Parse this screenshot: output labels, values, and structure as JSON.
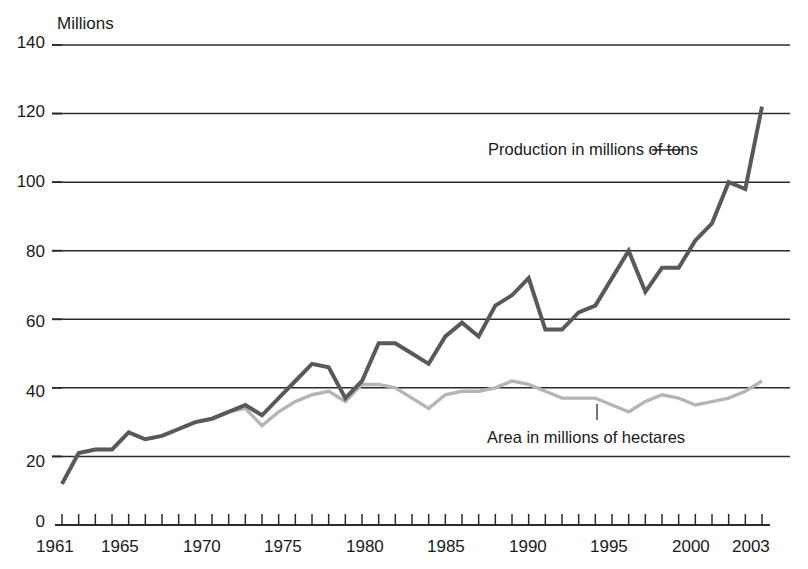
{
  "chart_data": {
    "type": "line",
    "title": "Millions",
    "xlabel": "",
    "ylabel": "",
    "grid": true,
    "legend_position": "inline-annotations",
    "xlim": [
      1961,
      2003
    ],
    "ylim": [
      0,
      140
    ],
    "yticks": [
      0,
      20,
      40,
      60,
      80,
      100,
      120,
      140
    ],
    "xticks_labeled": [
      1961,
      1965,
      1970,
      1975,
      1980,
      1985,
      1990,
      1995,
      2000,
      2003
    ],
    "xticks_all": [
      1961,
      1962,
      1963,
      1964,
      1965,
      1966,
      1967,
      1968,
      1969,
      1970,
      1971,
      1972,
      1973,
      1974,
      1975,
      1976,
      1977,
      1978,
      1979,
      1980,
      1981,
      1982,
      1983,
      1984,
      1985,
      1986,
      1987,
      1988,
      1989,
      1990,
      1991,
      1992,
      1993,
      1994,
      1995,
      1996,
      1997,
      1998,
      1999,
      2000,
      2001,
      2002,
      2003
    ],
    "x": [
      1961,
      1962,
      1963,
      1964,
      1965,
      1966,
      1967,
      1968,
      1969,
      1970,
      1971,
      1972,
      1973,
      1974,
      1975,
      1976,
      1977,
      1978,
      1979,
      1980,
      1981,
      1982,
      1983,
      1984,
      1985,
      1986,
      1987,
      1988,
      1989,
      1990,
      1991,
      1992,
      1993,
      1994,
      1995,
      1996,
      1997,
      1998,
      1999,
      2000,
      2001,
      2002,
      2003
    ],
    "series": [
      {
        "name": "Production in millions of tons",
        "color": "#595959",
        "values": [
          12,
          21,
          22,
          22,
          27,
          25,
          26,
          28,
          30,
          31,
          33,
          35,
          32,
          37,
          42,
          47,
          46,
          37,
          42,
          53,
          53,
          50,
          47,
          55,
          59,
          55,
          64,
          67,
          72,
          57,
          57,
          62,
          64,
          72,
          80,
          68,
          75,
          75,
          83,
          88,
          100,
          98,
          122
        ]
      },
      {
        "name": "Area in millions of hectares",
        "color": "#b5b5b5",
        "values": [
          12,
          21,
          22,
          22,
          27,
          25,
          26,
          28,
          30,
          31,
          33,
          34,
          29,
          33,
          36,
          38,
          39,
          36,
          41,
          41,
          40,
          37,
          34,
          38,
          39,
          39,
          40,
          42,
          41,
          39,
          37,
          37,
          37,
          35,
          33,
          36,
          38,
          37,
          35,
          36,
          37,
          39,
          42
        ]
      }
    ],
    "annotations": [
      {
        "text": "Production in millions of tons",
        "x_px": 488,
        "y_px": 140
      },
      {
        "text": "Area in millions of hectares",
        "x_px": 487,
        "y_px": 428
      }
    ]
  },
  "axis": {
    "title": "Millions",
    "y_labels": [
      "140",
      "120",
      "100",
      "80",
      "60",
      "40",
      "20",
      "0"
    ],
    "x_labels": [
      "1961",
      "1965",
      "1970",
      "1975",
      "1980",
      "1985",
      "1990",
      "1995",
      "2000",
      "2003"
    ]
  },
  "colors": {
    "production_line": "#595959",
    "area_line": "#b5b5b5",
    "gridline": "#2b2b2b",
    "text": "#1a1a1a"
  }
}
